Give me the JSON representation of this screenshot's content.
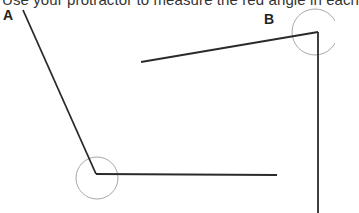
{
  "instruction": "Use your protractor to measure the red angle in each",
  "angles": [
    {
      "label": "A",
      "label_pos": [
        3,
        7
      ],
      "vertex": [
        96,
        174
      ],
      "arm1_end": [
        23,
        10
      ],
      "arm2_end": [
        277,
        175
      ],
      "arc": {
        "cx": 97,
        "cy": 178,
        "r": 21
      }
    },
    {
      "label": "B",
      "label_pos": [
        264,
        11
      ],
      "vertex": [
        318,
        32
      ],
      "arm1_end": [
        141,
        62
      ],
      "arm2_end": [
        318,
        213
      ],
      "arc": {
        "cx": 315,
        "cy": 32,
        "r": 23
      }
    }
  ],
  "colors": {
    "line": "#2a2a2a",
    "arc": "#a8a8a8",
    "text": "#333333"
  }
}
